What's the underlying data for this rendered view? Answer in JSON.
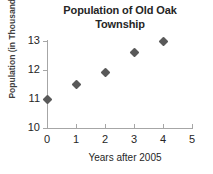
{
  "chart_data": {
    "type": "scatter",
    "title": "Population of Old Oak Township",
    "title_lines": [
      "Population of Old Oak",
      "Township"
    ],
    "xlabel": "Years after 2005",
    "ylabel": "Population (in Thousands)",
    "x": [
      0,
      1,
      2,
      3,
      4
    ],
    "values": [
      11.0,
      11.5,
      11.9,
      12.6,
      13.0
    ],
    "points": [
      {
        "x": 0,
        "y": 11.0
      },
      {
        "x": 1,
        "y": 11.5
      },
      {
        "x": 2,
        "y": 11.9
      },
      {
        "x": 3,
        "y": 12.6
      },
      {
        "x": 4,
        "y": 13.0
      }
    ],
    "xlim": [
      0,
      5
    ],
    "ylim": [
      10,
      13
    ],
    "xticks": [
      0,
      1,
      2,
      3,
      4,
      5
    ],
    "yticks": [
      10,
      11,
      12,
      13
    ],
    "xtick_labels": [
      "0",
      "1",
      "2",
      "3",
      "4",
      "5"
    ],
    "ytick_labels": [
      "10",
      "11",
      "12",
      "13"
    ],
    "grid": false,
    "legend": false,
    "marker_style": "diamond",
    "marker_color": "#595959",
    "axis_color": "#a6a6a6",
    "text_color": "#262626",
    "background": "#ffffff"
  }
}
